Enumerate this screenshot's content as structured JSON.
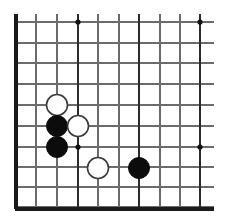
{
  "figure": {
    "title": "Go board position diagram",
    "board_kind": "go-board",
    "view": "cropped corner view",
    "background_color": "#ffffff",
    "line_color": "#6b6b6b",
    "major_line_color": "#2b2b2b",
    "edge_color": "#1a1a1a",
    "black_stone_color": "#0c0c0c",
    "white_stone_color": "#ffffff",
    "white_stone_outline_color": "#3a3a3a",
    "star_point_color": "#111111",
    "stone_radius": 10.5,
    "star_radius": 2.6
  },
  "grid": {
    "cell_size": 20.4,
    "vertical_line_x": [
      16,
      36,
      57,
      78,
      98,
      119,
      139,
      160,
      180,
      200
    ],
    "horizontal_line_y": [
      22,
      43,
      63,
      84,
      105,
      126,
      147,
      167,
      187,
      207
    ],
    "vertical_overshoot_top": 8,
    "vertical_overshoot_right": 14,
    "major_vertical_x": [
      16,
      78,
      139,
      200
    ],
    "major_horizontal_y": [],
    "left_edge_x": 16,
    "bottom_edge_y": 209,
    "top_line_y": 22,
    "right_line_x": 200
  },
  "star_points": [
    {
      "name": "star-top-left-area",
      "x": 78,
      "y": 22
    },
    {
      "name": "star-top-right-area",
      "x": 200,
      "y": 22
    },
    {
      "name": "star-lower-left-area",
      "x": 78,
      "y": 147
    },
    {
      "name": "star-lower-right-area",
      "x": 200,
      "y": 147
    }
  ],
  "stones": [
    {
      "name": "stone-white-1",
      "color": "white",
      "x": 57,
      "y": 105
    },
    {
      "name": "stone-black-1",
      "color": "black",
      "x": 57,
      "y": 126
    },
    {
      "name": "stone-white-2",
      "color": "white",
      "x": 78,
      "y": 126
    },
    {
      "name": "stone-black-2",
      "color": "black",
      "x": 57,
      "y": 147
    },
    {
      "name": "stone-white-3",
      "color": "white",
      "x": 98,
      "y": 168
    },
    {
      "name": "stone-black-3",
      "color": "black",
      "x": 139,
      "y": 168
    }
  ],
  "counts": {
    "black_stones": 3,
    "white_stones": 3,
    "total_stones": 6,
    "star_points": 4
  }
}
